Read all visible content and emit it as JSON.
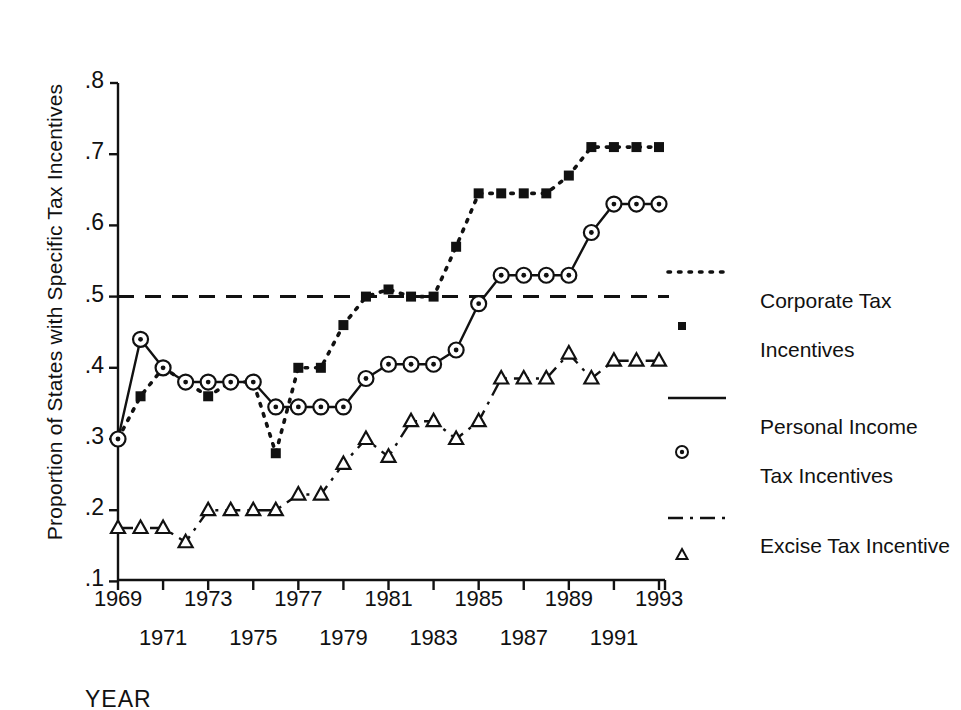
{
  "chart_data": {
    "type": "line",
    "title": "",
    "xlabel": "YEAR",
    "ylabel": "Proportion of States with Specific Tax Incentives",
    "xlim": [
      1969,
      1993
    ],
    "ylim": [
      0.1,
      0.8
    ],
    "grid": false,
    "legend_position": "right",
    "yticks": [
      ".1",
      ".2",
      ".3",
      ".4",
      ".5",
      ".6",
      ".7",
      ".8"
    ],
    "ytick_values": [
      0.1,
      0.2,
      0.3,
      0.4,
      0.5,
      0.6,
      0.7,
      0.8
    ],
    "xticks_row1": [
      "1969",
      "1973",
      "1977",
      "1981",
      "1985",
      "1989",
      "1993"
    ],
    "xticks_row2": [
      "1971",
      "1975",
      "1979",
      "1983",
      "1987",
      "1991"
    ],
    "xtick_values_row1": [
      1969,
      1973,
      1977,
      1981,
      1985,
      1989,
      1993
    ],
    "xtick_values_row2": [
      1971,
      1975,
      1979,
      1983,
      1987,
      1991
    ],
    "x": [
      1969,
      1970,
      1971,
      1972,
      1973,
      1974,
      1975,
      1976,
      1977,
      1978,
      1979,
      1980,
      1981,
      1982,
      1983,
      1984,
      1985,
      1986,
      1987,
      1988,
      1989,
      1990,
      1991,
      1992,
      1993
    ],
    "reference_line": {
      "name": "0.5 reference",
      "value": 0.5,
      "style": "dashed"
    },
    "series": [
      {
        "name": "Corporate Tax Incentives",
        "marker": "filled-square",
        "linestyle": "dotted",
        "values": [
          0.3,
          0.36,
          0.4,
          0.38,
          0.36,
          0.38,
          0.38,
          0.28,
          0.4,
          0.4,
          0.46,
          0.5,
          0.51,
          0.5,
          0.5,
          0.57,
          0.645,
          0.645,
          0.645,
          0.645,
          0.67,
          0.71,
          0.71,
          0.71,
          0.71
        ]
      },
      {
        "name": "Personal Income Tax Incentives",
        "marker": "circle-dot",
        "linestyle": "solid",
        "values": [
          0.3,
          0.44,
          0.4,
          0.38,
          0.38,
          0.38,
          0.38,
          0.345,
          0.345,
          0.345,
          0.345,
          0.385,
          0.405,
          0.405,
          0.405,
          0.425,
          0.49,
          0.53,
          0.53,
          0.53,
          0.53,
          0.59,
          0.63,
          0.63,
          0.63
        ]
      },
      {
        "name": "Excise Tax Incentive",
        "marker": "open-triangle",
        "linestyle": "dashdot",
        "values": [
          0.175,
          0.175,
          0.175,
          0.155,
          0.2,
          0.2,
          0.2,
          0.2,
          0.222,
          0.222,
          0.265,
          0.3,
          0.275,
          0.325,
          0.325,
          0.3,
          0.325,
          0.385,
          0.385,
          0.385,
          0.42,
          0.385,
          0.41,
          0.41,
          0.41
        ]
      }
    ]
  },
  "axis": {
    "ylabel": "Proportion of States with Specific Tax Incentives",
    "xlabel": "YEAR"
  },
  "legend": {
    "items": [
      {
        "label_line1": "Corporate Tax",
        "label_line2": "Incentives",
        "marker": "filled-square",
        "linestyle": "dotted"
      },
      {
        "label_line1": "Personal Income",
        "label_line2": "Tax Incentives",
        "marker": "circle-dot",
        "linestyle": "solid"
      },
      {
        "label_line1": "Excise Tax Incentive",
        "label_line2": "",
        "marker": "open-triangle",
        "linestyle": "dashdot"
      }
    ]
  },
  "colors": {
    "ink": "#111111",
    "background": "#ffffff"
  }
}
